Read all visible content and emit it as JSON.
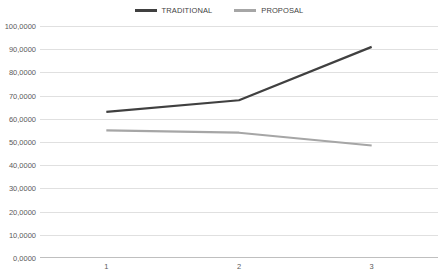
{
  "chart_data": {
    "type": "line",
    "title": "",
    "xlabel": "",
    "ylabel": "",
    "categories": [
      "1",
      "2",
      "3"
    ],
    "x": [
      1,
      2,
      3
    ],
    "ylim": [
      0,
      100
    ],
    "ytick_step": 10,
    "grid": true,
    "legend_position": "top-center",
    "ytick_labels": [
      "100,0000",
      "90,0000",
      "80,0000",
      "70,0000",
      "60,0000",
      "50,0000",
      "40,0000",
      "30,0000",
      "20,0000",
      "10,0000",
      "0,0000"
    ],
    "ytick_values": [
      100,
      90,
      80,
      70,
      60,
      50,
      40,
      30,
      20,
      10,
      0
    ],
    "series": [
      {
        "name": "TRADITIONAL",
        "color": "#404040",
        "values": [
          63.0,
          68.0,
          91.0
        ]
      },
      {
        "name": "PROPOSAL",
        "color": "#a6a6a6",
        "values": [
          55.0,
          54.0,
          48.5
        ]
      }
    ]
  },
  "legend": {
    "items": [
      {
        "label": "TRADITIONAL",
        "swatch": "traditional"
      },
      {
        "label": "PROPOSAL",
        "swatch": "proposal"
      }
    ]
  },
  "colors": {
    "traditional": "#404040",
    "proposal": "#a6a6a6",
    "gridline": "#e0e0e0",
    "axis": "#bfbfbf",
    "text": "#5a5a5a",
    "background": "#ffffff"
  }
}
